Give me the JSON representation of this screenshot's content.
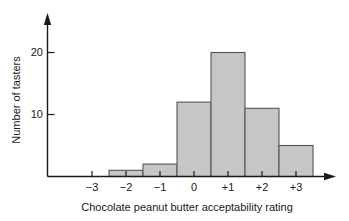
{
  "chart_data": {
    "type": "bar",
    "title": "",
    "xlabel": "Chocolate peanut butter acceptability rating",
    "ylabel": "Number of tasters",
    "categories": [
      "-3",
      "-2",
      "-1",
      "0",
      "+1",
      "+2",
      "+3"
    ],
    "values": [
      0,
      1,
      2,
      12,
      20,
      11,
      5
    ],
    "xtick_labels": [
      "−3",
      "−2",
      "−1",
      "0",
      "+1",
      "+2",
      "+3"
    ],
    "ytick_labels": [
      "10",
      "20"
    ],
    "ytick_values": [
      10,
      20
    ],
    "ylim": [
      0,
      23
    ],
    "grid": false,
    "legend": false,
    "bar_fill_color": "#c6c6c6",
    "bar_edge_color": "#555555",
    "axis_color": "#1a1a1a"
  },
  "axes": {
    "y_label": "Number of tasters",
    "x_label": "Chocolate peanut butter acceptability rating"
  }
}
